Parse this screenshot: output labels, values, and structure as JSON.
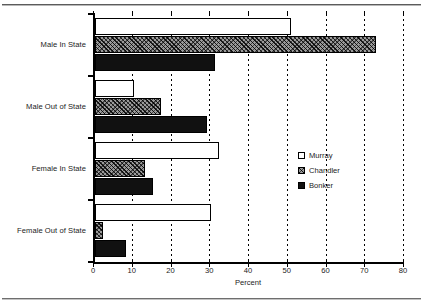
{
  "page": {
    "clipped_top_caption": "",
    "background_color": "#ffffff"
  },
  "chart_data": {
    "type": "bar",
    "orientation": "horizontal",
    "title": "",
    "xlabel": "Percent",
    "ylabel": "",
    "xlim": [
      0,
      80
    ],
    "xticks": [
      0,
      10,
      20,
      30,
      40,
      50,
      60,
      70,
      80
    ],
    "xtick_labels": [
      "0",
      "10",
      "20",
      "30",
      "40",
      "50",
      "60",
      "70",
      "80"
    ],
    "grid": "vertical-dotted",
    "legend_position": "center-right",
    "categories": [
      "Male In State",
      "Male Out of State",
      "Female In State",
      "Female Out of State"
    ],
    "series": [
      {
        "name": "Murray",
        "fill": "white",
        "color": "#ffffff",
        "values": [
          50.5,
          10,
          32,
          30
        ]
      },
      {
        "name": "Chandler",
        "fill": "hatched",
        "color": "#9a9a9a",
        "values": [
          72.5,
          17,
          13,
          2
        ]
      },
      {
        "name": "Bonker",
        "fill": "solid-black",
        "color": "#111111",
        "values": [
          31,
          29,
          15,
          8
        ]
      }
    ]
  },
  "legend": {
    "entries": [
      {
        "label": "Murray",
        "swatch": "murray-swatch"
      },
      {
        "label": "Chandler",
        "swatch": "chandler-swatch"
      },
      {
        "label": "Bonker",
        "swatch": "bonker-swatch"
      }
    ]
  }
}
